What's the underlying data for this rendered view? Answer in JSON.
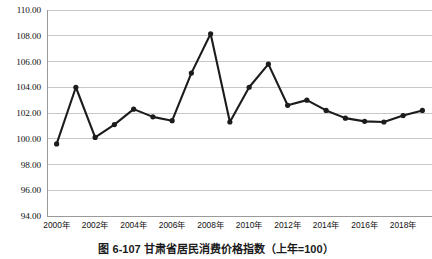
{
  "caption": "图 6-107  甘肃省居民消费价格指数（上年=100）",
  "chart_data": {
    "type": "line",
    "title": "",
    "subtitle": "",
    "xlabel": "",
    "ylabel": "",
    "ylim": [
      94.0,
      110.0
    ],
    "ytick_step": 2.0,
    "grid": true,
    "legend": "none",
    "marker": "filled-circle",
    "line_color": "#1c1c1c",
    "grid_color": "#b9b9b9",
    "background": "#ffffff",
    "ytick_labels": [
      "110.00",
      "108.00",
      "106.00",
      "104.00",
      "102.00",
      "100.00",
      "98.00",
      "96.00",
      "94.00"
    ],
    "ytick_values": [
      110.0,
      108.0,
      106.0,
      104.0,
      102.0,
      100.0,
      98.0,
      96.0,
      94.0
    ],
    "xtick_labels": [
      "2000年",
      "2002年",
      "2004年",
      "2006年",
      "2008年",
      "2010年",
      "2012年",
      "2014年",
      "2016年",
      "2018年"
    ],
    "xtick_values": [
      2000,
      2002,
      2004,
      2006,
      2008,
      2010,
      2012,
      2014,
      2016,
      2018
    ],
    "x": [
      2000,
      2001,
      2002,
      2003,
      2004,
      2005,
      2006,
      2007,
      2008,
      2009,
      2010,
      2011,
      2012,
      2013,
      2014,
      2015,
      2016,
      2017,
      2018,
      2019
    ],
    "categories": [
      "2000年",
      "2001年",
      "2002年",
      "2003年",
      "2004年",
      "2005年",
      "2006年",
      "2007年",
      "2008年",
      "2009年",
      "2010年",
      "2011年",
      "2012年",
      "2013年",
      "2014年",
      "2015年",
      "2016年",
      "2017年",
      "2018年",
      "2019年"
    ],
    "values": [
      99.6,
      104.0,
      100.1,
      101.1,
      102.3,
      101.7,
      101.4,
      105.1,
      108.15,
      101.3,
      104.0,
      105.8,
      102.6,
      103.0,
      102.2,
      101.6,
      101.35,
      101.3,
      101.8,
      102.2
    ],
    "series": [
      {
        "name": "甘肃省居民消费价格指数",
        "values": [
          99.6,
          104.0,
          100.1,
          101.1,
          102.3,
          101.7,
          101.4,
          105.1,
          108.15,
          101.3,
          104.0,
          105.8,
          102.6,
          103.0,
          102.2,
          101.6,
          101.35,
          101.3,
          101.8,
          102.2
        ]
      }
    ]
  }
}
